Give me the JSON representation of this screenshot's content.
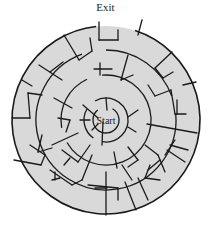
{
  "labels": {
    "exit": "Exit",
    "start": "Start"
  },
  "colors": {
    "fill": "#d9d9d9",
    "wall": "#1a1a1a",
    "background": "#ffffff"
  },
  "maze": {
    "center": [
      106,
      120
    ],
    "rings": [
      {
        "r": 94,
        "gaps": [
          [
            -96,
            -72
          ]
        ]
      },
      {
        "r": 70,
        "gaps": [
          [
            -110,
            -90
          ],
          [
            -20,
            -5
          ]
        ]
      },
      {
        "r": 45,
        "gaps": [
          [
            -115,
            -95
          ],
          [
            150,
            170
          ]
        ]
      },
      {
        "r": 22,
        "gaps": [
          [
            -150,
            -120
          ],
          [
            100,
            125
          ]
        ]
      },
      {
        "r": 13,
        "gaps": [
          [
            -130,
            -60
          ]
        ]
      }
    ],
    "walls": [
      [
        99,
        22,
        99,
        40
      ],
      [
        99,
        40,
        118,
        40
      ],
      [
        118,
        40,
        118,
        30
      ],
      [
        64,
        35,
        79,
        60
      ],
      [
        79,
        60,
        92,
        51
      ],
      [
        92,
        51,
        90,
        38
      ],
      [
        39,
        65,
        62,
        80
      ],
      [
        50,
        72,
        63,
        62
      ],
      [
        22,
        80,
        32,
        86
      ],
      [
        42,
        95,
        28,
        93
      ],
      [
        28,
        93,
        30,
        118
      ],
      [
        30,
        118,
        12,
        118
      ],
      [
        54,
        98,
        72,
        108
      ],
      [
        100,
        63,
        100,
        75
      ],
      [
        94,
        69,
        112,
        69
      ],
      [
        128,
        55,
        121,
        80
      ],
      [
        121,
        80,
        133,
        75
      ],
      [
        142,
        20,
        138,
        35
      ],
      [
        172,
        52,
        155,
        68
      ],
      [
        155,
        68,
        163,
        78
      ],
      [
        163,
        78,
        173,
        72
      ],
      [
        183,
        85,
        196,
        82
      ],
      [
        148,
        85,
        155,
        96
      ],
      [
        155,
        96,
        171,
        90
      ],
      [
        171,
        90,
        175,
        114
      ],
      [
        175,
        114,
        186,
        114
      ],
      [
        177,
        100,
        177,
        114
      ],
      [
        147,
        124,
        197,
        133
      ],
      [
        128,
        117,
        138,
        110
      ],
      [
        128,
        127,
        136,
        132
      ],
      [
        83,
        105,
        98,
        118
      ],
      [
        106,
        98,
        107,
        110
      ],
      [
        80,
        120,
        90,
        120
      ],
      [
        98,
        124,
        92,
        130
      ],
      [
        103,
        122,
        102,
        145
      ],
      [
        58,
        118,
        70,
        120
      ],
      [
        70,
        120,
        66,
        132
      ],
      [
        42,
        135,
        38,
        152
      ],
      [
        38,
        152,
        52,
        148
      ],
      [
        52,
        145,
        78,
        133
      ],
      [
        30,
        145,
        45,
        155
      ],
      [
        45,
        155,
        41,
        165
      ],
      [
        41,
        165,
        14,
        160
      ],
      [
        62,
        150,
        78,
        162
      ],
      [
        78,
        162,
        90,
        145
      ],
      [
        70,
        158,
        64,
        165
      ],
      [
        50,
        170,
        72,
        185
      ],
      [
        72,
        185,
        82,
        180
      ],
      [
        82,
        180,
        92,
        155
      ],
      [
        55,
        172,
        55,
        180
      ],
      [
        52,
        180,
        60,
        178
      ],
      [
        128,
        147,
        138,
        160
      ],
      [
        138,
        160,
        128,
        167
      ],
      [
        122,
        165,
        132,
        180
      ],
      [
        145,
        145,
        158,
        155
      ],
      [
        158,
        155,
        165,
        172
      ],
      [
        150,
        165,
        145,
        178
      ],
      [
        145,
        178,
        160,
        180
      ],
      [
        175,
        140,
        165,
        155
      ],
      [
        167,
        150,
        185,
        162
      ],
      [
        170,
        145,
        188,
        150
      ],
      [
        138,
        178,
        148,
        200
      ],
      [
        125,
        182,
        136,
        210
      ],
      [
        88,
        185,
        118,
        188
      ],
      [
        118,
        188,
        118,
        200
      ],
      [
        106,
        172,
        106,
        215
      ],
      [
        95,
        188,
        107,
        188
      ],
      [
        148,
        170,
        160,
        160
      ],
      [
        114,
        152,
        117,
        168
      ]
    ]
  }
}
